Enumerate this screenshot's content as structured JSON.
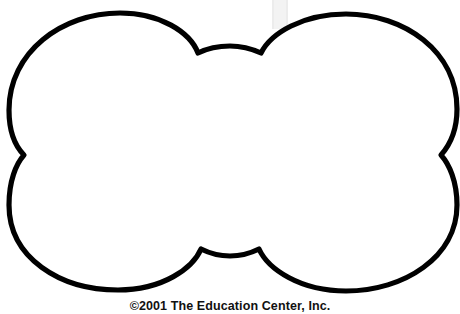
{
  "page": {
    "width": 460,
    "height": 314,
    "background_color": "#ffffff"
  },
  "artwork": {
    "name": "bone-shape-outline",
    "description": "Blank dog-bone / biscuit shaped outline pattern with four rounded lobes, open white interior",
    "stroke_color": "#000000",
    "fill_color": "#ffffff",
    "stroke_width": 5
  },
  "scan_artifact": {
    "name": "grey-band",
    "color": "#ececec",
    "inner_color": "#f3f3f3"
  },
  "credit": {
    "text": "©2001 The Education Center, Inc.",
    "color": "#111111"
  }
}
